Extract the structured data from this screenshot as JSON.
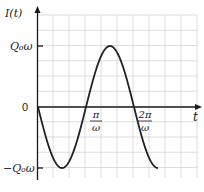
{
  "chart_data": {
    "type": "line",
    "title": "",
    "xlabel": "t",
    "ylabel": "I(t)",
    "function": "I(t) = -Q0*omega*sin(omega*t)",
    "x_ticks": [
      {
        "value": "pi/omega",
        "num": "π",
        "den": "ω"
      },
      {
        "value": "2pi/omega",
        "num": "2π",
        "den": "ω"
      }
    ],
    "y_ticks": [
      {
        "value": "Q0*omega",
        "label": "Q₀ω"
      },
      {
        "value": 0,
        "label": "0"
      },
      {
        "value": "-Q0*omega",
        "label": "−Q₀ω"
      }
    ],
    "series": [
      {
        "name": "I(t)",
        "x_units_of_pi_over_omega": [
          0,
          0.25,
          0.5,
          0.75,
          1.0,
          1.25,
          1.5,
          1.75,
          2.0,
          2.25,
          2.5
        ],
        "y_units_of_Q0_omega": [
          0,
          -0.707,
          -1,
          -0.707,
          0,
          0.707,
          1,
          0.707,
          0,
          -0.707,
          -1
        ]
      }
    ],
    "grid": true,
    "xlim_units_of_pi_over_omega": [
      0,
      3.33
    ],
    "ylim_units_of_Q0_omega": [
      -1.2,
      1.5
    ]
  },
  "labels": {
    "y_axis": "I(t)",
    "x_axis": "t",
    "y_pos": "Q₀ω",
    "y_zero": "0",
    "y_neg": "−Q₀ω",
    "x_tick1_num": "π",
    "x_tick1_den": "ω",
    "x_tick2_num": "2π",
    "x_tick2_den": "ω"
  }
}
